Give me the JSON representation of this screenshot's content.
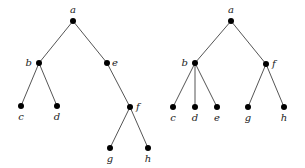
{
  "diagram": {
    "type": "rooted-trees",
    "colors": {
      "edge": "#555555",
      "node": "#000000",
      "label": "#222222",
      "background": "#ffffff"
    },
    "trees": [
      {
        "name": "left-tree",
        "nodes": [
          {
            "id": "a",
            "label": "a",
            "x": 73,
            "y": 21,
            "lx": 73,
            "ly": 13,
            "anchor": "middle"
          },
          {
            "id": "b",
            "label": "b",
            "x": 39,
            "y": 63,
            "lx": 32,
            "ly": 66,
            "anchor": "end"
          },
          {
            "id": "e",
            "label": "e",
            "x": 107,
            "y": 63,
            "lx": 112,
            "ly": 66,
            "anchor": "start"
          },
          {
            "id": "c",
            "label": "c",
            "x": 21,
            "y": 106,
            "lx": 21,
            "ly": 120,
            "anchor": "middle"
          },
          {
            "id": "d",
            "label": "d",
            "x": 57,
            "y": 106,
            "lx": 57,
            "ly": 120,
            "anchor": "middle"
          },
          {
            "id": "f",
            "label": "f",
            "x": 130,
            "y": 107,
            "lx": 136,
            "ly": 110,
            "anchor": "start"
          },
          {
            "id": "g",
            "label": "g",
            "x": 110,
            "y": 148,
            "lx": 110,
            "ly": 162,
            "anchor": "middle"
          },
          {
            "id": "h",
            "label": "h",
            "x": 148,
            "y": 148,
            "lx": 148,
            "ly": 162,
            "anchor": "middle"
          }
        ],
        "edges": [
          [
            "a",
            "b"
          ],
          [
            "a",
            "e"
          ],
          [
            "b",
            "c"
          ],
          [
            "b",
            "d"
          ],
          [
            "e",
            "f"
          ],
          [
            "f",
            "g"
          ],
          [
            "f",
            "h"
          ]
        ]
      },
      {
        "name": "right-tree",
        "nodes": [
          {
            "id": "a",
            "label": "a",
            "x": 231,
            "y": 21,
            "lx": 231,
            "ly": 13,
            "anchor": "middle"
          },
          {
            "id": "b",
            "label": "b",
            "x": 195,
            "y": 63,
            "lx": 188,
            "ly": 66,
            "anchor": "end"
          },
          {
            "id": "f",
            "label": "f",
            "x": 266,
            "y": 64,
            "lx": 272,
            "ly": 67,
            "anchor": "start"
          },
          {
            "id": "c",
            "label": "c",
            "x": 173,
            "y": 107,
            "lx": 173,
            "ly": 121,
            "anchor": "middle"
          },
          {
            "id": "d",
            "label": "d",
            "x": 195,
            "y": 107,
            "lx": 195,
            "ly": 121,
            "anchor": "middle"
          },
          {
            "id": "e",
            "label": "e",
            "x": 217,
            "y": 107,
            "lx": 217,
            "ly": 121,
            "anchor": "middle"
          },
          {
            "id": "g",
            "label": "g",
            "x": 248,
            "y": 107,
            "lx": 248,
            "ly": 121,
            "anchor": "middle"
          },
          {
            "id": "h",
            "label": "h",
            "x": 284,
            "y": 107,
            "lx": 284,
            "ly": 121,
            "anchor": "middle"
          }
        ],
        "edges": [
          [
            "a",
            "b"
          ],
          [
            "a",
            "f"
          ],
          [
            "b",
            "c"
          ],
          [
            "b",
            "d"
          ],
          [
            "b",
            "e"
          ],
          [
            "f",
            "g"
          ],
          [
            "f",
            "h"
          ]
        ]
      }
    ]
  }
}
